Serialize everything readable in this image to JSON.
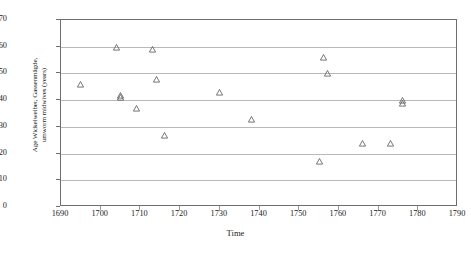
{
  "chart_data": {
    "type": "scatter",
    "title": "",
    "xlabel": "Time",
    "ylabel_lines": [
      "Age  Wickelweiber,  Gassenmägde,",
      "umworm midwives (years)"
    ],
    "ylabel": "Age Wickelweiber, Gassenmägde, umworm midwives (years)",
    "xlim": [
      1690,
      1790
    ],
    "ylim": [
      0,
      70
    ],
    "xticks": [
      1690,
      1700,
      1710,
      1720,
      1730,
      1740,
      1750,
      1760,
      1770,
      1780,
      1790
    ],
    "yticks": [
      0,
      10,
      20,
      30,
      40,
      50,
      60,
      70
    ],
    "grid": "horizontal",
    "legend": "none",
    "marker": "open-triangle",
    "marker_color": "#555555",
    "points": [
      {
        "x": 1695,
        "y": 46
      },
      {
        "x": 1704,
        "y": 60
      },
      {
        "x": 1705,
        "y": 42
      },
      {
        "x": 1705,
        "y": 41
      },
      {
        "x": 1709,
        "y": 37
      },
      {
        "x": 1713,
        "y": 59
      },
      {
        "x": 1714,
        "y": 48
      },
      {
        "x": 1716,
        "y": 27
      },
      {
        "x": 1730,
        "y": 43
      },
      {
        "x": 1738,
        "y": 33
      },
      {
        "x": 1755,
        "y": 17
      },
      {
        "x": 1756,
        "y": 56
      },
      {
        "x": 1757,
        "y": 50
      },
      {
        "x": 1766,
        "y": 24
      },
      {
        "x": 1773,
        "y": 24
      },
      {
        "x": 1776,
        "y": 40
      },
      {
        "x": 1776,
        "y": 39
      }
    ]
  }
}
